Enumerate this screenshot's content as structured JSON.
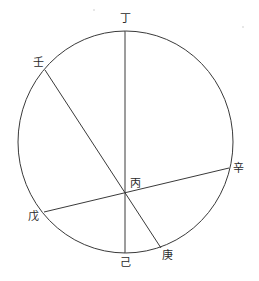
{
  "diagram": {
    "title": "",
    "circle": {
      "cx": 125.5,
      "cy": 142,
      "rx": 107.5,
      "ry": 111
    },
    "lines": [
      {
        "name": "ding-ji",
        "from": "丁",
        "to": "己",
        "x1": 125,
        "y1": 31,
        "x2": 125,
        "y2": 253
      },
      {
        "name": "ren-geng",
        "from": "壬",
        "to": "庚",
        "x1": 45,
        "y1": 70,
        "x2": 161,
        "y2": 248
      },
      {
        "name": "wu-xin",
        "from": "戊",
        "to": "辛",
        "x1": 44,
        "y1": 212,
        "x2": 229,
        "y2": 168
      }
    ],
    "labels": {
      "ding": {
        "text": "丁",
        "x": 125,
        "y": 22
      },
      "ren": {
        "text": "壬",
        "x": 38,
        "y": 66
      },
      "xin": {
        "text": "辛",
        "x": 238,
        "y": 172
      },
      "bing": {
        "text": "丙",
        "x": 135,
        "y": 187
      },
      "wu": {
        "text": "戊",
        "x": 33,
        "y": 220
      },
      "ji": {
        "text": "己",
        "x": 125,
        "y": 266
      },
      "geng": {
        "text": "庚",
        "x": 167,
        "y": 259
      }
    },
    "center_point": {
      "label": "丙",
      "x": 125,
      "y": 193
    }
  }
}
